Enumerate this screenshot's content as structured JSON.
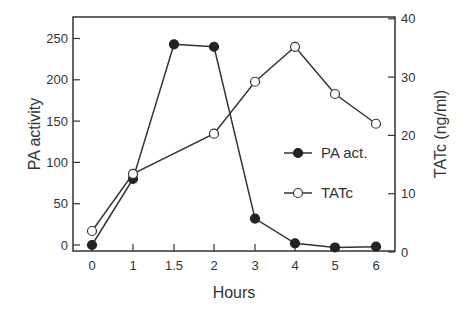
{
  "chart_data": {
    "type": "line",
    "title": "",
    "xlabel": "Hours",
    "ylabel": "PA activity",
    "y2label": "TATc (ng/ml)",
    "x": [
      "0",
      "1",
      "1.5",
      "2",
      "3",
      "4",
      "5",
      "6"
    ],
    "x_tick_labels": [
      "0",
      "1",
      "1.5",
      "2",
      "3",
      "4",
      "5",
      "6"
    ],
    "ylim": [
      0,
      270
    ],
    "y_ticks": [
      0,
      50,
      100,
      150,
      200,
      250
    ],
    "y2lim": [
      0,
      40
    ],
    "y2_ticks": [
      0,
      10,
      20,
      30,
      40
    ],
    "grid": false,
    "legend_position": "inside-right",
    "series": [
      {
        "name": "PA act.",
        "axis": "left",
        "marker": "filled-circle",
        "x": [
          "0",
          "1",
          "1.5",
          "2",
          "3",
          "4",
          "5",
          "6"
        ],
        "values": [
          0,
          80,
          243,
          240,
          32,
          2,
          -3,
          -2
        ]
      },
      {
        "name": "TATc",
        "axis": "right",
        "marker": "open-circle",
        "x": [
          "0",
          "1",
          "2",
          "3",
          "4",
          "5",
          "6"
        ],
        "values": [
          3.6,
          13.4,
          20.3,
          29.2,
          35.2,
          27.1,
          22.0
        ]
      }
    ]
  },
  "legend": {
    "items": [
      {
        "label": "PA act."
      },
      {
        "label": "TATc"
      }
    ]
  },
  "colors": {
    "line": "#333333",
    "marker_fill": "#222222",
    "open_marker_fill": "#ffffff",
    "background": "#ffffff"
  }
}
